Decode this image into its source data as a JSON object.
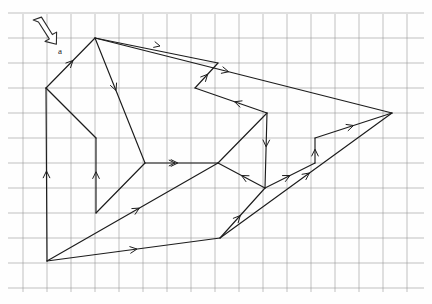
{
  "figure": {
    "title": "",
    "label_a": "a",
    "colors": {
      "grid": "#9a9a9a",
      "stroke": "#1c1c1c",
      "background": "#fefefe",
      "cursor_fill": "#ffffff"
    },
    "grid": {
      "origin_x": 47,
      "origin_y": 38,
      "spacing_x": 24,
      "spacing_y": 25,
      "cols": 16,
      "rows": 10,
      "visible": true
    },
    "cursor": {
      "name": "arrow-cursor",
      "x": 33,
      "y": 18,
      "direction": "down-right"
    },
    "vertices": [
      {
        "id": "v_top",
        "x": 95,
        "y": 38
      },
      {
        "id": "v_left_up",
        "x": 46,
        "y": 88
      },
      {
        "id": "v_mid_left",
        "x": 96,
        "y": 138
      },
      {
        "id": "v_mid_hub",
        "x": 145,
        "y": 163
      },
      {
        "id": "v_low_left",
        "x": 96,
        "y": 213
      },
      {
        "id": "v_bottom_left",
        "x": 47,
        "y": 261
      },
      {
        "id": "v_bottom_mid",
        "x": 220,
        "y": 238
      },
      {
        "id": "v_center",
        "x": 218,
        "y": 163
      },
      {
        "id": "v_low_mid",
        "x": 265,
        "y": 188
      },
      {
        "id": "v_step_low",
        "x": 315,
        "y": 163
      },
      {
        "id": "v_step_high",
        "x": 315,
        "y": 138
      },
      {
        "id": "v_right",
        "x": 392,
        "y": 113
      },
      {
        "id": "v_notch_in",
        "x": 267,
        "y": 113
      },
      {
        "id": "v_notch_up",
        "x": 195,
        "y": 88
      },
      {
        "id": "v_notch_top",
        "x": 218,
        "y": 63
      }
    ],
    "segments": [
      {
        "name": "seg-left-up-to-top",
        "from": "v_left_up",
        "to": "v_top",
        "arrow": "forward",
        "arrow_t": 0.55
      },
      {
        "name": "seg-top-to-right",
        "from": "v_top",
        "to": "v_right",
        "arrow": "forward",
        "arrow_t": 0.45
      },
      {
        "name": "seg-top-to-mid-hub",
        "from": "v_top",
        "to": "v_mid_hub",
        "arrow": "forward",
        "arrow_t": 0.42
      },
      {
        "name": "seg-mid-hub-to-low-left",
        "from": "v_mid_hub",
        "to": "v_low_left",
        "arrow": "none",
        "arrow_t": 0.5
      },
      {
        "name": "seg-low-left-to-mid-left",
        "from": "v_low_left",
        "to": "v_mid_left",
        "arrow": "forward",
        "arrow_t": 0.55
      },
      {
        "name": "seg-mid-left-to-left-up",
        "from": "v_mid_left",
        "to": "v_left_up",
        "arrow": "none",
        "arrow_t": 0.5
      },
      {
        "name": "seg-bottom-left-vertical",
        "from": "v_bottom_left",
        "to": "v_left_up",
        "arrow": "forward",
        "arrow_t": 0.52
      },
      {
        "name": "seg-bottom-left-to-center",
        "from": "v_bottom_left",
        "to": "v_center",
        "arrow": "forward",
        "arrow_t": 0.54
      },
      {
        "name": "seg-bottom-left-to-bmid",
        "from": "v_bottom_left",
        "to": "v_bottom_mid",
        "arrow": "forward",
        "arrow_t": 0.52
      },
      {
        "name": "seg-mid-hub-to-center",
        "from": "v_mid_hub",
        "to": "v_center",
        "arrow": "forward",
        "arrow_t": 0.45
      },
      {
        "name": "seg-center-to-notch-in",
        "from": "v_center",
        "to": "v_notch_in",
        "arrow": "none",
        "arrow_t": 0.5
      },
      {
        "name": "seg-notch-in-to-notch-up",
        "from": "v_notch_in",
        "to": "v_notch_up",
        "arrow": "forward",
        "arrow_t": 0.45
      },
      {
        "name": "seg-notch-up-to-notch-top",
        "from": "v_notch_up",
        "to": "v_notch_top",
        "arrow": "forward",
        "arrow_t": 0.55
      },
      {
        "name": "seg-notch-top-to-top",
        "from": "v_notch_top",
        "to": "v_top",
        "arrow": "none",
        "arrow_t": 0.5
      },
      {
        "name": "seg-notch-in-to-step",
        "from": "v_notch_in",
        "to": "v_low_mid",
        "arrow": "forward",
        "arrow_t": 0.45
      },
      {
        "name": "seg-low-mid-to-center",
        "from": "v_low_mid",
        "to": "v_center",
        "arrow": "forward",
        "arrow_t": 0.5
      },
      {
        "name": "seg-low-mid-to-step-low",
        "from": "v_low_mid",
        "to": "v_step_low",
        "arrow": "forward",
        "arrow_t": 0.5
      },
      {
        "name": "seg-step-vertical",
        "from": "v_step_low",
        "to": "v_step_high",
        "arrow": "forward",
        "arrow_t": 0.55
      },
      {
        "name": "seg-step-high-to-right",
        "from": "v_step_high",
        "to": "v_right",
        "arrow": "forward",
        "arrow_t": 0.5
      },
      {
        "name": "seg-bmid-to-low-mid",
        "from": "v_bottom_mid",
        "to": "v_low_mid",
        "arrow": "forward",
        "arrow_t": 0.45
      },
      {
        "name": "seg-bmid-to-right",
        "from": "v_bottom_mid",
        "to": "v_right",
        "arrow": "forward",
        "arrow_t": 0.52
      }
    ],
    "extra_arrow_marks": [
      {
        "name": "tick-mid-hub-horizontal",
        "x": 175,
        "y": 163,
        "angle": 0
      },
      {
        "name": "tick-top-right-path",
        "x": 160,
        "y": 46,
        "angle": 14
      }
    ]
  }
}
